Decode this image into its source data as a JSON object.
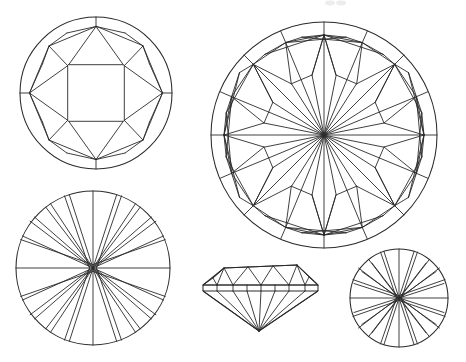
{
  "figure": {
    "background_color": "#ffffff",
    "line_color": "#2a2a2a",
    "width": 466,
    "height": 362,
    "caption": "",
    "artifact_note": "faint scan smudge at top edge"
  },
  "diagrams": [
    {
      "id": "crown-view-large",
      "name": "Crown view (top) - round brilliant",
      "position": "top-left",
      "center": [
        96,
        93
      ],
      "radius": 76,
      "facet_count": 33,
      "description": "Crown of a round brilliant cut showing table, star facets, bezel (kite) facets and upper girdle halves"
    },
    {
      "id": "pavilion-view-detailed",
      "name": "Pavilion / full facet view - round brilliant",
      "position": "top-right",
      "center": [
        324,
        135
      ],
      "radius": 113,
      "facet_count": 58,
      "description": "Detailed facet map of a round brilliant showing overlapping crown and pavilion facet arrangement"
    },
    {
      "id": "pavilion-view-medium",
      "name": "Pavilion view (bottom) - round brilliant",
      "position": "bottom-left",
      "center": [
        93,
        268
      ],
      "radius": 77,
      "facet_count": 25,
      "description": "Pavilion of a round brilliant with 16 main facets radiating from the culet"
    },
    {
      "id": "profile-view",
      "name": "Profile / side view - round brilliant",
      "position": "bottom-center",
      "table_y": 268,
      "girdle_y": 289,
      "culet_y": 331,
      "left_x": 203,
      "right_x": 318,
      "description": "Side elevation showing table, crown, girdle, pavilion and culet"
    },
    {
      "id": "pavilion-view-small",
      "name": "Pavilion view (bottom) - small round brilliant",
      "position": "bottom-right",
      "center": [
        399,
        298
      ],
      "radius": 49,
      "facet_count": 25,
      "description": "Smaller pavilion view with 16 main facets radiating from the culet"
    }
  ]
}
